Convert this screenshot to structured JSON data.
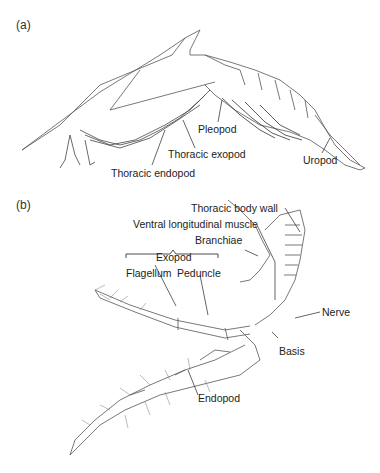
{
  "panels": [
    {
      "id": "a",
      "label": "(a)",
      "annotations": [
        "Pleopod",
        "Thoracic exopod",
        "Thoracic endopod",
        "Uropod"
      ]
    },
    {
      "id": "b",
      "label": "(b)",
      "annotations": [
        "Thoracic body wall",
        "Ventral longitudinal muscle",
        "Branchiae",
        "Exopod",
        "Flagellum",
        "Peduncle",
        "Nerve",
        "Basis",
        "Endopod"
      ]
    }
  ],
  "colors": {
    "line": "#333333",
    "background": "#ffffff"
  }
}
